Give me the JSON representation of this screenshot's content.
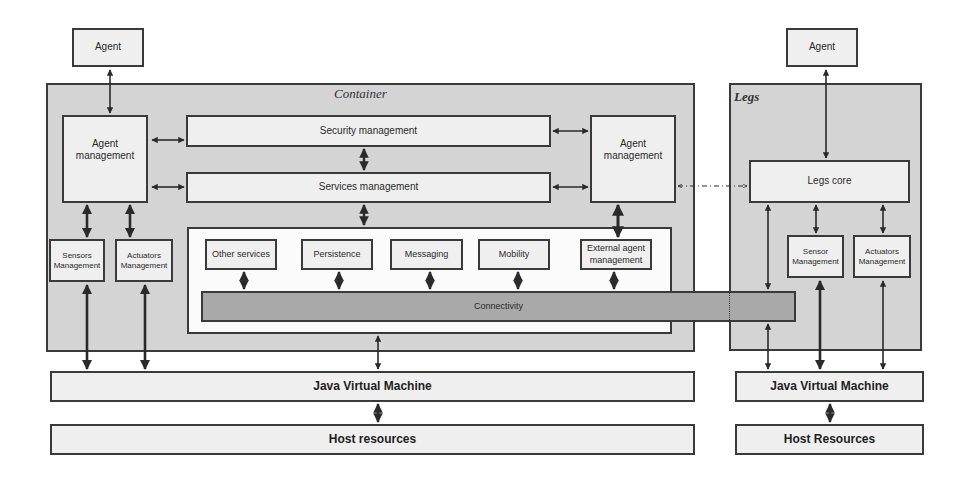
{
  "container": {
    "title": "Container",
    "agent": "Agent",
    "agent_management_left": "Agent management",
    "security_management": "Security management",
    "services_management": "Services management",
    "agent_management_right": "Agent management",
    "sensors_management": "Sensors Management",
    "actuators_management": "Actuators Management",
    "services": [
      {
        "label": "Other services"
      },
      {
        "label": "Persistence"
      },
      {
        "label": "Messaging"
      },
      {
        "label": "Mobility"
      },
      {
        "label": "External agent management"
      }
    ],
    "connectivity": "Connectivity",
    "jvm": "Java Virtual Machine",
    "host": "Host resources"
  },
  "legs": {
    "title": "Legs",
    "agent": "Agent",
    "legs_core": "Legs core",
    "sensor_management": "Sensor Management",
    "actuators_management": "Actuators Management",
    "jvm": "Java Virtual Machine",
    "host": "Host Resources"
  },
  "colors": {
    "panel": "#d4d4d4",
    "box": "#efefef",
    "connectivity": "#a9a9a9",
    "line": "#3a3a3a"
  }
}
